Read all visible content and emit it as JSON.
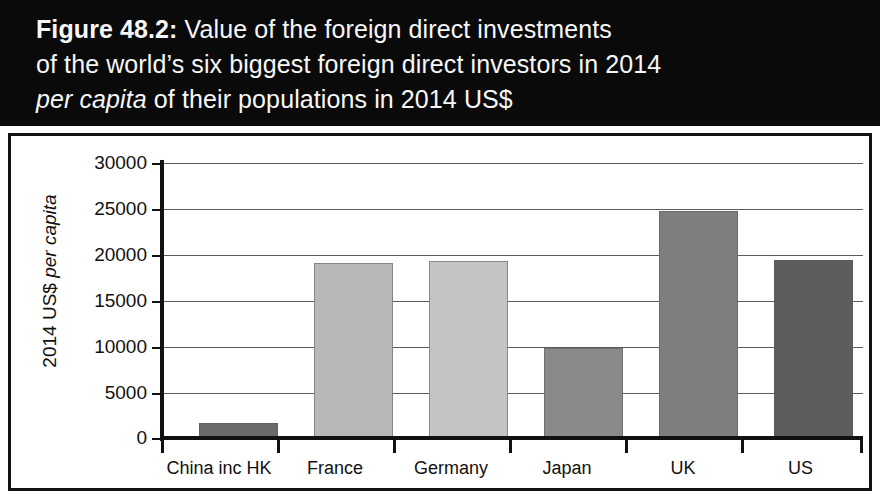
{
  "title": {
    "line1_strong": "Figure 48.2:",
    "line1_rest": " Value of the foreign direct investments",
    "line2": "of the world’s six biggest foreign direct investors in 2014",
    "line3_italic": "per capita",
    "line3_rest": " of their populations in 2014 US$"
  },
  "axis": {
    "y_title_plain": "2014 US$ ",
    "y_title_italic": "per capita",
    "y_ticks": [
      "30000",
      "25000",
      "20000",
      "15000",
      "10000",
      "5000",
      "0"
    ]
  },
  "colors": {
    "title_band": "#0a0a0a",
    "title_text": "#f7f7f7",
    "frame": "#111111",
    "gridline": "#5a5a5a",
    "bar_china": "#6b6b6b",
    "bar_france": "#b8b8b8",
    "bar_germany": "#c4c4c4",
    "bar_japan": "#8a8a8a",
    "bar_uk": "#7e7e7e",
    "bar_us": "#5d5d5d"
  },
  "chart_data": {
    "type": "bar",
    "title": "Figure 48.2: Value of the foreign direct investments of the world’s six biggest foreign direct investors in 2014 per capita of their populations in 2014 US$",
    "xlabel": "",
    "ylabel": "2014 US$ per capita",
    "ylim": [
      0,
      30000
    ],
    "ytick_interval": 5000,
    "grid": true,
    "legend": false,
    "categories": [
      "China inc HK",
      "France",
      "Germany",
      "Japan",
      "UK",
      "US"
    ],
    "values": [
      1650,
      19100,
      19300,
      9800,
      24800,
      19400
    ],
    "bar_colors": [
      "#6b6b6b",
      "#b8b8b8",
      "#c4c4c4",
      "#8a8a8a",
      "#7e7e7e",
      "#5d5d5d"
    ]
  }
}
